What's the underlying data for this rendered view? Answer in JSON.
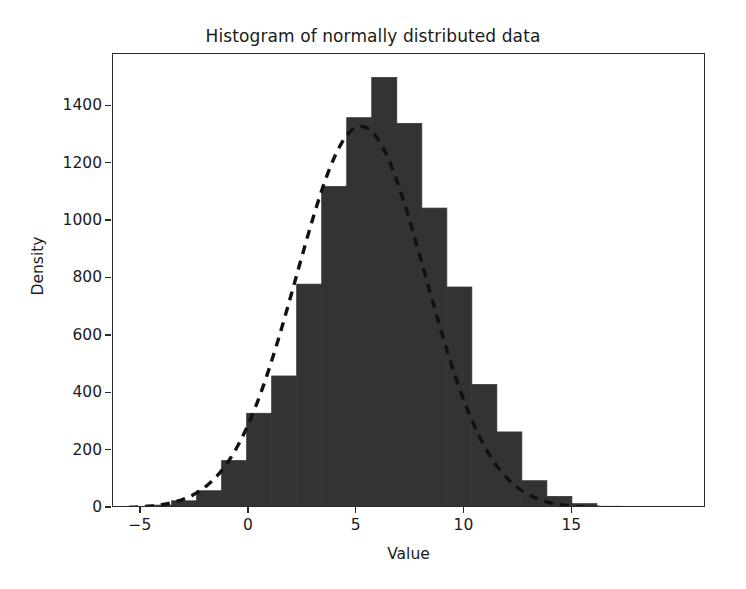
{
  "chart_data": {
    "type": "bar",
    "title": "Histogram of normally distributed data",
    "xlabel": "Value",
    "ylabel": "Density",
    "xlim": [
      -6.3,
      21.2
    ],
    "ylim": [
      0,
      1582
    ],
    "grid": false,
    "legend": null,
    "bar_color": "#333333",
    "bar_edge_color": "#333333",
    "curve_color": "#111111",
    "curve_style": "dashed",
    "xticks": [
      -5,
      0,
      5,
      10,
      15
    ],
    "xtick_labels": [
      "−5",
      "0",
      "5",
      "10",
      "15"
    ],
    "yticks": [
      0,
      200,
      400,
      600,
      800,
      1000,
      1200,
      1400
    ],
    "ytick_labels": [
      "0",
      "200",
      "400",
      "600",
      "800",
      "1000",
      "1200",
      "1400"
    ],
    "bin_width": 1.16,
    "bin_edges": [
      -4.74,
      -3.58,
      -2.42,
      -1.26,
      -0.1,
      1.06,
      2.22,
      3.38,
      4.54,
      5.7,
      6.86,
      8.02,
      9.18,
      10.34,
      11.5,
      12.66,
      13.82,
      14.98,
      16.14,
      17.3,
      18.46
    ],
    "bin_centers": [
      -4.16,
      -3.0,
      -1.84,
      -0.68,
      0.48,
      1.64,
      2.8,
      3.96,
      5.12,
      6.28,
      7.44,
      8.6,
      9.76,
      10.92,
      12.08,
      13.24,
      14.4,
      15.56,
      16.72,
      17.88
    ],
    "values": [
      10,
      25,
      60,
      165,
      330,
      460,
      780,
      1120,
      1360,
      1500,
      1340,
      1045,
      770,
      430,
      265,
      95,
      40,
      15,
      6,
      3
    ],
    "curve": {
      "name": "normal density fit",
      "peak_x": 5.2,
      "peak_y": 1330,
      "mean": 5.2,
      "sigma": 3.0,
      "amplitude": 1330
    },
    "series": [
      {
        "name": "histogram",
        "values": [
          10,
          25,
          60,
          165,
          330,
          460,
          780,
          1120,
          1360,
          1500,
          1340,
          1045,
          770,
          430,
          265,
          95,
          40,
          15,
          6,
          3
        ]
      }
    ]
  },
  "axes": {
    "title": "Histogram of normally distributed data",
    "xlabel": "Value",
    "ylabel": "Density"
  }
}
